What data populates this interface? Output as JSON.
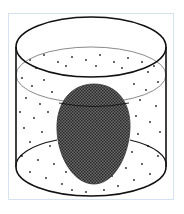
{
  "figure": {
    "colors": {
      "frame_border": "#d6e3ee",
      "outline": "#111111",
      "liquid_surface_line": "#888888",
      "egg_fill": "#4a4a4a",
      "particle": "#222222",
      "background": "#ffffff"
    },
    "elements": [
      {
        "name": "container",
        "shape": "cylinder"
      },
      {
        "name": "liquid",
        "pattern": "dots"
      },
      {
        "name": "egg",
        "pattern": "dense-stipple"
      }
    ]
  }
}
